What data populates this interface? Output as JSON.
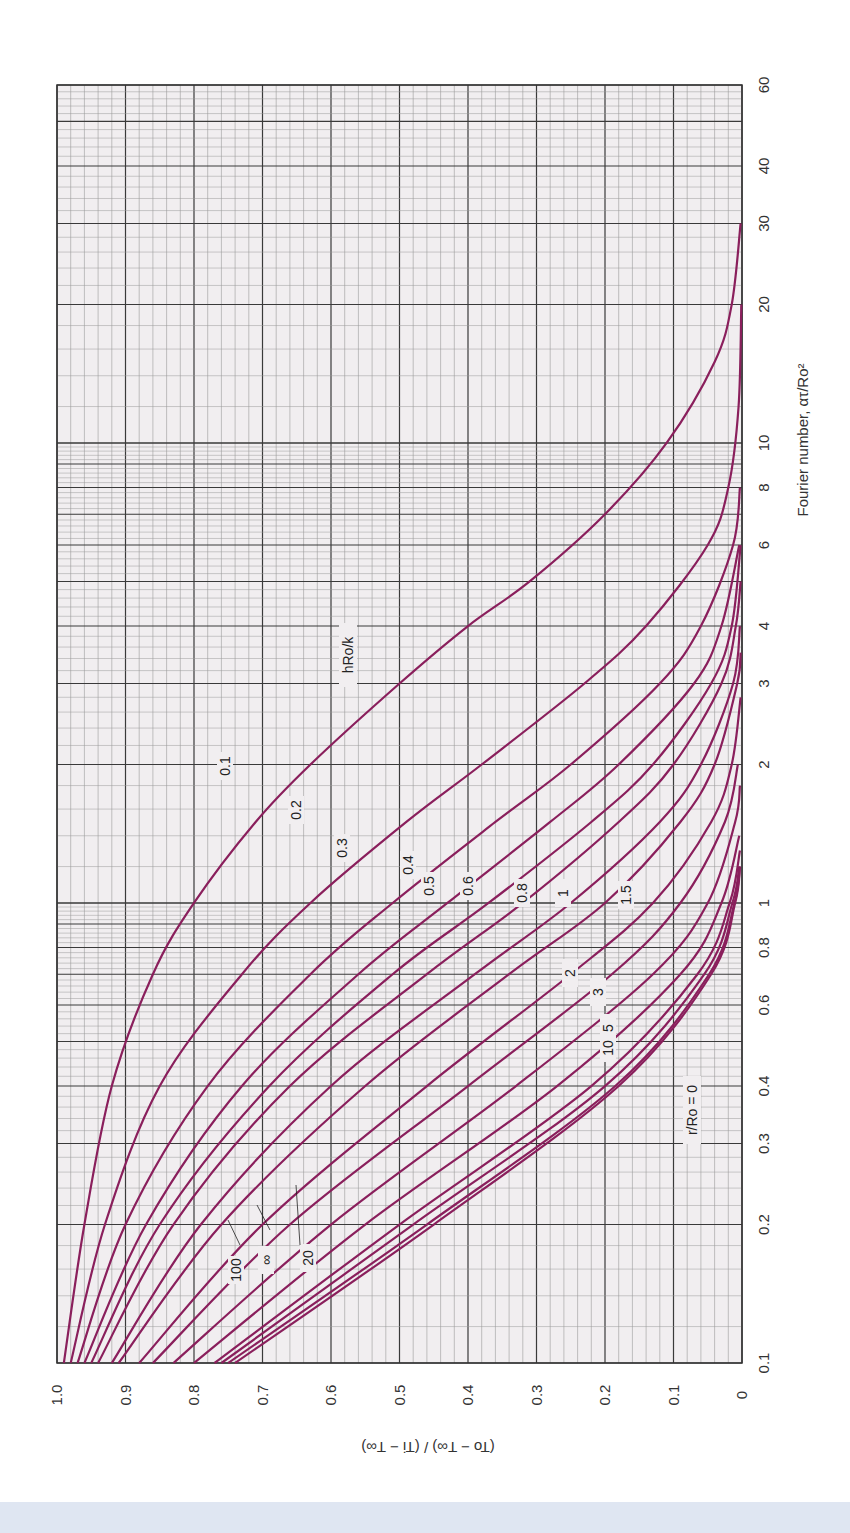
{
  "chart_data": {
    "type": "line",
    "orientation": "rotated-90-ccw",
    "title": "",
    "xlabel": "Fourier number, ατ/Ro²",
    "ylabel": "(To − T∞) / (Ti − T∞)",
    "xscale": "log",
    "xlim": [
      0.1,
      60
    ],
    "ylim": [
      0,
      1.0
    ],
    "x_ticks": [
      "0.1",
      "0.2",
      "0.3",
      "0.4",
      "0.6",
      "0.8",
      "1",
      "2",
      "3",
      "4",
      "6",
      "8",
      "10",
      "20",
      "30",
      "40",
      "60"
    ],
    "y_ticks": [
      "0",
      "0.1",
      "0.2",
      "0.3",
      "0.4",
      "0.5",
      "0.6",
      "0.7",
      "0.8",
      "0.9",
      "1.0"
    ],
    "grid": true,
    "parameter_label": "hRo/k",
    "annotation": "r/Ro = 0",
    "series": [
      {
        "name": "0.1",
        "x": [
          0.1,
          0.2,
          0.4,
          0.7,
          1.0,
          1.5,
          2.0,
          3.0,
          4.0,
          5.0,
          7.0,
          10,
          15,
          20,
          30
        ],
        "values": [
          0.99,
          0.96,
          0.92,
          0.86,
          0.8,
          0.71,
          0.63,
          0.5,
          0.4,
          0.31,
          0.2,
          0.11,
          0.04,
          0.015,
          0.002
        ]
      },
      {
        "name": "0.2",
        "x": [
          0.1,
          0.2,
          0.4,
          0.7,
          1.0,
          1.5,
          2.0,
          3.0,
          4.0,
          6.0,
          8.0,
          12,
          20
        ],
        "values": [
          0.98,
          0.93,
          0.85,
          0.73,
          0.63,
          0.49,
          0.38,
          0.23,
          0.14,
          0.05,
          0.02,
          0.005,
          0.001
        ]
      },
      {
        "name": "0.3",
        "x": [
          0.1,
          0.2,
          0.4,
          0.7,
          1.0,
          1.5,
          2.0,
          3.0,
          4.0,
          6.0,
          8.0
        ],
        "values": [
          0.97,
          0.9,
          0.78,
          0.63,
          0.51,
          0.36,
          0.25,
          0.12,
          0.06,
          0.013,
          0.003
        ]
      },
      {
        "name": "0.4",
        "x": [
          0.1,
          0.2,
          0.4,
          0.7,
          1.0,
          1.5,
          2.0,
          3.0,
          4.0,
          6.0
        ],
        "values": [
          0.96,
          0.87,
          0.73,
          0.56,
          0.43,
          0.28,
          0.18,
          0.07,
          0.03,
          0.004
        ]
      },
      {
        "name": "0.5",
        "x": [
          0.1,
          0.2,
          0.4,
          0.7,
          1.0,
          1.5,
          2.0,
          3.0,
          4.0,
          6.0
        ],
        "values": [
          0.95,
          0.85,
          0.69,
          0.51,
          0.37,
          0.22,
          0.13,
          0.045,
          0.015,
          0.002
        ]
      },
      {
        "name": "0.6",
        "x": [
          0.1,
          0.2,
          0.4,
          0.7,
          1.0,
          1.5,
          2.0,
          3.0,
          4.0,
          5.0
        ],
        "values": [
          0.94,
          0.83,
          0.66,
          0.46,
          0.32,
          0.18,
          0.1,
          0.03,
          0.009,
          0.002
        ]
      },
      {
        "name": "0.8",
        "x": [
          0.1,
          0.2,
          0.4,
          0.7,
          1.0,
          1.5,
          2.0,
          3.0,
          4.0
        ],
        "values": [
          0.92,
          0.79,
          0.6,
          0.39,
          0.25,
          0.12,
          0.06,
          0.013,
          0.003
        ]
      },
      {
        "name": "1",
        "x": [
          0.1,
          0.2,
          0.4,
          0.7,
          1.0,
          1.5,
          2.0,
          3.0,
          3.5
        ],
        "values": [
          0.91,
          0.76,
          0.55,
          0.34,
          0.2,
          0.09,
          0.04,
          0.007,
          0.002
        ]
      },
      {
        "name": "1.5",
        "x": [
          0.1,
          0.2,
          0.4,
          0.7,
          1.0,
          1.5,
          2.0,
          2.8
        ],
        "values": [
          0.88,
          0.7,
          0.46,
          0.25,
          0.13,
          0.045,
          0.015,
          0.002
        ]
      },
      {
        "name": "2",
        "x": [
          0.1,
          0.2,
          0.4,
          0.7,
          1.0,
          1.5,
          2.0
        ],
        "values": [
          0.86,
          0.66,
          0.4,
          0.19,
          0.09,
          0.025,
          0.006
        ]
      },
      {
        "name": "3",
        "x": [
          0.1,
          0.2,
          0.4,
          0.7,
          1.0,
          1.5,
          1.8
        ],
        "values": [
          0.83,
          0.6,
          0.33,
          0.13,
          0.05,
          0.01,
          0.003
        ]
      },
      {
        "name": "5",
        "x": [
          0.1,
          0.2,
          0.4,
          0.7,
          1.0,
          1.4
        ],
        "values": [
          0.8,
          0.55,
          0.27,
          0.09,
          0.03,
          0.004
        ]
      },
      {
        "name": "10",
        "x": [
          0.1,
          0.2,
          0.4,
          0.7,
          1.0,
          1.3
        ],
        "values": [
          0.77,
          0.5,
          0.22,
          0.065,
          0.018,
          0.003
        ]
      },
      {
        "name": "20",
        "x": [
          0.1,
          0.2,
          0.4,
          0.7,
          1.0,
          1.2
        ],
        "values": [
          0.76,
          0.48,
          0.2,
          0.055,
          0.014,
          0.004
        ]
      },
      {
        "name": "100",
        "x": [
          0.1,
          0.2,
          0.4,
          0.7,
          1.0,
          1.2
        ],
        "values": [
          0.75,
          0.46,
          0.185,
          0.048,
          0.011,
          0.003
        ]
      },
      {
        "name": "∞",
        "x": [
          0.1,
          0.2,
          0.4,
          0.7,
          1.0,
          1.2
        ],
        "values": [
          0.74,
          0.45,
          0.18,
          0.045,
          0.01,
          0.003
        ]
      }
    ],
    "colors": {
      "curve": "#8a1f5c",
      "grid_major": "#3a3a3a",
      "grid_minor": "#9a9a9a",
      "plot_bg": "#f1eef0"
    }
  },
  "labels": {
    "y_axis_title": "(To − T∞) / (Ti − T∞)",
    "x_axis_title": "Fourier number, ατ/Ro²",
    "param": "hRo/k",
    "position": "r/Ro = 0"
  }
}
